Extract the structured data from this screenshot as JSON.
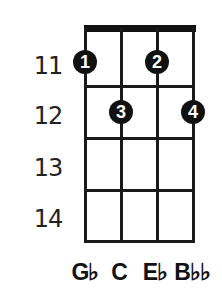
{
  "chord_diagram": {
    "instrument_strings": 4,
    "start_fret": 11,
    "fret_numbers": [
      "11",
      "12",
      "13",
      "14"
    ],
    "fingers": [
      {
        "string": 1,
        "fret": 11,
        "label": "1"
      },
      {
        "string": 3,
        "fret": 11,
        "label": "2"
      },
      {
        "string": 2,
        "fret": 12,
        "label": "3"
      },
      {
        "string": 4,
        "fret": 12,
        "label": "4"
      }
    ],
    "notes": [
      "G♭",
      "C",
      "E♭",
      "B♭♭"
    ],
    "colors": {
      "line": "#1a1a1a",
      "dot": "#111111",
      "dot_text": "#ffffff",
      "background": "#ffffff"
    }
  }
}
